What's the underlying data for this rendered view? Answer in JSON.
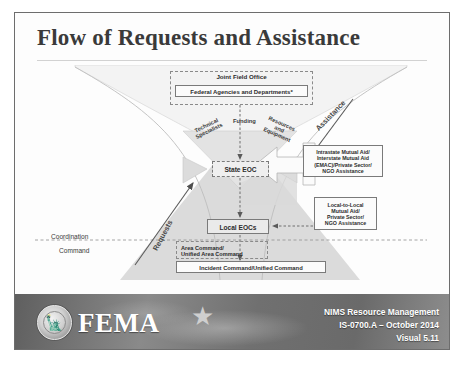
{
  "slide": {
    "title": "Flow of Requests and Assistance"
  },
  "diagram": {
    "joint_field_office": "Joint Field Office",
    "federal_agencies": "Federal Agencies and Departments*",
    "state_eoc": "State EOC",
    "local_eocs": "Local EOCs",
    "mutual_aid_state": "Intrastate Mutual Aid/\nInterstate Mutual Aid\n(EMAC)/Private Sector/\nNGO Assistance",
    "mutual_aid_local": "Local-to-Local\nMutual Aid/\nPrivate Sector/\nNGO Assistance",
    "area_command": "Area Command/\nUnified Area Command",
    "incident_command": "Incident Command/Unified Command",
    "funnel_labels": {
      "technical": "Technical\nSpecialists",
      "funding": "Funding",
      "resources": "Resources\nand\nEquipment"
    },
    "flow_arrows": {
      "assistance": "Assistance",
      "requests": "Requests"
    },
    "axis_labels": {
      "coordination": "Coordination",
      "command": "Command"
    }
  },
  "footer": {
    "brand": "FEMA",
    "line1": "NIMS Resource Management",
    "line2": "IS-0700.A – October 2014",
    "line3": "Visual 5.11"
  },
  "colors": {
    "footer_bg": "#6f6f6f",
    "title_text": "#3a3a3a",
    "pyramid_fill": "#d8d8d8",
    "funnel_fill": "#e6e6e6"
  }
}
